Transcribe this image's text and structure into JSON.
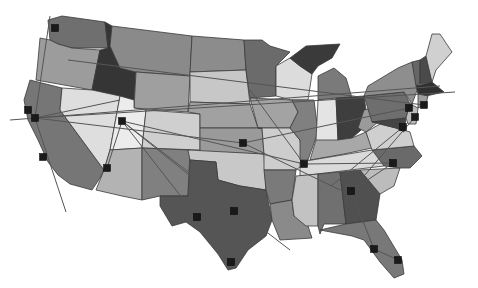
{
  "map": {
    "title": "",
    "background": "#ffffff",
    "states": [
      {
        "id": "WA",
        "fill": "#6f6f6f",
        "points": "48,20 62,16 105,22 108,48 72,48 58,44 50,40"
      },
      {
        "id": "OR",
        "fill": "#9c9c9c",
        "points": "40,38 50,40 58,44 72,48 100,50 92,90 36,80 38,60"
      },
      {
        "id": "CA",
        "fill": "#767676",
        "points": "30,80 62,88 60,110 104,170 100,178 92,190 70,184 58,175 48,162 38,140 28,120 24,100"
      },
      {
        "id": "ID",
        "fill": "#353535",
        "points": "105,22 112,26 110,46 120,68 136,72 134,100 92,90 100,50 108,48"
      },
      {
        "id": "NV",
        "fill": "#dedede",
        "points": "62,88 92,90 120,96 110,150 104,170 60,110"
      },
      {
        "id": "MT",
        "fill": "#8a8a8a",
        "points": "112,26 192,36 190,76 136,72 120,68 110,46"
      },
      {
        "id": "WY",
        "fill": "#9f9f9f",
        "points": "136,72 190,76 188,112 134,108"
      },
      {
        "id": "UT",
        "fill": "#ececec",
        "points": "120,96 134,100 134,108 146,110 142,148 110,150"
      },
      {
        "id": "AZ",
        "fill": "#b3b3b3",
        "points": "110,150 142,148 142,200 122,196 96,190 104,170"
      },
      {
        "id": "CO",
        "fill": "#cfcfcf",
        "points": "146,110 200,114 200,150 142,148"
      },
      {
        "id": "NM",
        "fill": "#808080",
        "points": "142,148 190,150 188,196 160,196 142,200"
      },
      {
        "id": "ND",
        "fill": "#8c8c8c",
        "points": "192,36 244,40 246,70 190,72"
      },
      {
        "id": "SD",
        "fill": "#c7c7c7",
        "points": "190,72 246,70 250,104 190,102"
      },
      {
        "id": "NE",
        "fill": "#a1a1a1",
        "points": "190,102 250,104 258,128 200,128 200,114 188,112"
      },
      {
        "id": "KS",
        "fill": "#9a9a9a",
        "points": "200,128 262,128 264,154 200,152"
      },
      {
        "id": "OK",
        "fill": "#c8c8c8",
        "points": "188,150 264,154 266,190 240,186 218,180 216,162 190,160"
      },
      {
        "id": "TX",
        "fill": "#555555",
        "points": "190,160 216,162 218,180 240,186 266,190 272,220 266,236 248,250 236,268 228,270 218,254 200,232 186,222 172,226 160,206 160,196 188,196"
      },
      {
        "id": "MN",
        "fill": "#6b6b6b",
        "points": "244,40 262,40 270,46 290,52 276,66 276,96 250,98 246,70"
      },
      {
        "id": "IA",
        "fill": "#a3a3a3",
        "points": "250,98 292,100 298,112 290,128 258,128"
      },
      {
        "id": "MO",
        "fill": "#cdcdcd",
        "points": "258,128 290,128 300,140 304,164 296,170 264,170 264,154 262,128"
      },
      {
        "id": "AR",
        "fill": "#7a7a7a",
        "points": "264,170 296,170 292,200 270,204 266,190"
      },
      {
        "id": "LA",
        "fill": "#8a8a8a",
        "points": "270,204 292,200 294,216 306,220 312,238 280,240 272,220"
      },
      {
        "id": "WI",
        "fill": "#dcdcdc",
        "points": "276,66 290,58 300,66 312,74 308,100 292,100 276,96"
      },
      {
        "id": "IL",
        "fill": "#808080",
        "points": "292,100 314,100 318,132 308,160 300,160 300,140 290,128 298,112"
      },
      {
        "id": "MI",
        "fill": "#3a3a3a",
        "points": "306,46 340,44 332,58 318,66 312,74 300,66 290,58"
      },
      {
        "id": "MI2",
        "fill": "#7a7a7a",
        "points": "318,76 334,68 346,78 352,98 318,100"
      },
      {
        "id": "IN",
        "fill": "#e4e4e4",
        "points": "318,100 336,98 338,140 322,148 316,140"
      },
      {
        "id": "OH",
        "fill": "#3e3e3e",
        "points": "336,98 364,96 368,124 352,138 338,140"
      },
      {
        "id": "KY",
        "fill": "#a8a8a8",
        "points": "316,140 338,140 352,138 366,132 372,148 344,154 310,160"
      },
      {
        "id": "TN",
        "fill": "#dadada",
        "points": "300,162 372,150 392,152 384,166 300,176"
      },
      {
        "id": "MS",
        "fill": "#c2c2c2",
        "points": "296,176 318,174 318,226 306,226 294,216 292,200"
      },
      {
        "id": "AL",
        "fill": "#707070",
        "points": "318,174 340,172 346,224 324,224 320,234 318,226"
      },
      {
        "id": "GA",
        "fill": "#505050",
        "points": "340,172 360,170 380,194 376,220 346,224"
      },
      {
        "id": "FL",
        "fill": "#787878",
        "points": "320,230 346,224 376,220 384,230 402,260 404,274 394,278 380,262 364,240 352,236"
      },
      {
        "id": "SC",
        "fill": "#bcbcbc",
        "points": "360,170 400,168 394,186 380,194"
      },
      {
        "id": "NC",
        "fill": "#6a6a6a",
        "points": "372,150 414,146 422,156 410,168 400,168 384,166"
      },
      {
        "id": "VA",
        "fill": "#cfcfcf",
        "points": "366,132 380,124 396,128 410,132 414,146 372,150"
      },
      {
        "id": "WV",
        "fill": "#9a9a9a",
        "points": "364,110 372,108 378,122 366,132 358,128"
      },
      {
        "id": "PA",
        "fill": "#6e6e6e",
        "points": "364,96 404,92 410,104 406,118 372,122"
      },
      {
        "id": "NY",
        "fill": "#8e8e8e",
        "points": "368,86 398,68 412,62 418,88 412,104 404,92 364,96"
      },
      {
        "id": "MD",
        "fill": "#444444",
        "points": "372,122 406,118 404,132 396,128 380,124"
      },
      {
        "id": "NJ",
        "fill": "#bcbcbc",
        "points": "410,104 418,108 416,124 408,124 406,118"
      },
      {
        "id": "VT",
        "fill": "#666666",
        "points": "412,62 420,60 420,84 416,86"
      },
      {
        "id": "NH",
        "fill": "#4a4a4a",
        "points": "420,60 426,56 432,82 420,84"
      },
      {
        "id": "ME",
        "fill": "#d0d0d0",
        "points": "426,56 432,34 440,34 452,52 436,70 432,82"
      },
      {
        "id": "MA",
        "fill": "#303030",
        "points": "416,86 432,82 444,92 426,96 418,94"
      },
      {
        "id": "CT",
        "fill": "#9e9e9e",
        "points": "418,94 428,96 426,104 418,108"
      }
    ],
    "markers": [
      {
        "name": "Seattle",
        "x": 55,
        "y": 28
      },
      {
        "name": "San Francisco",
        "x": 28,
        "y": 110
      },
      {
        "name": "Oakland",
        "x": 35,
        "y": 118
      },
      {
        "name": "Los Angeles",
        "x": 43,
        "y": 157
      },
      {
        "name": "Phoenix",
        "x": 107,
        "y": 168
      },
      {
        "name": "Salt Lake City",
        "x": 122,
        "y": 121
      },
      {
        "name": "Kansas City",
        "x": 243,
        "y": 143
      },
      {
        "name": "St. Louis",
        "x": 304,
        "y": 164
      },
      {
        "name": "Fort Worth",
        "x": 197,
        "y": 217
      },
      {
        "name": "Dallas",
        "x": 234,
        "y": 211
      },
      {
        "name": "Houston",
        "x": 231,
        "y": 262
      },
      {
        "name": "Atlanta",
        "x": 351,
        "y": 191
      },
      {
        "name": "Charlotte",
        "x": 393,
        "y": 163
      },
      {
        "name": "Tampa",
        "x": 374,
        "y": 249
      },
      {
        "name": "Miami",
        "x": 398,
        "y": 260
      },
      {
        "name": "Boston",
        "x": 424,
        "y": 105
      },
      {
        "name": "New York",
        "x": 409,
        "y": 108
      },
      {
        "name": "Philadelphia",
        "x": 415,
        "y": 117
      },
      {
        "name": "Washington",
        "x": 403,
        "y": 127
      }
    ],
    "routes": [
      {
        "x1": 10,
        "y1": 120,
        "x2": 440,
        "y2": 86
      },
      {
        "x1": 35,
        "y1": 118,
        "x2": 455,
        "y2": 92
      },
      {
        "x1": 68,
        "y1": 60,
        "x2": 424,
        "y2": 105
      },
      {
        "x1": 50,
        "y1": 16,
        "x2": 35,
        "y2": 118
      },
      {
        "x1": 35,
        "y1": 118,
        "x2": 66,
        "y2": 212
      },
      {
        "x1": 35,
        "y1": 118,
        "x2": 243,
        "y2": 143
      },
      {
        "x1": 35,
        "y1": 118,
        "x2": 120,
        "y2": 100
      },
      {
        "x1": 122,
        "y1": 121,
        "x2": 304,
        "y2": 164
      },
      {
        "x1": 122,
        "y1": 121,
        "x2": 234,
        "y2": 211
      },
      {
        "x1": 122,
        "y1": 121,
        "x2": 197,
        "y2": 217
      },
      {
        "x1": 122,
        "y1": 121,
        "x2": 107,
        "y2": 168
      },
      {
        "x1": 122,
        "y1": 121,
        "x2": 290,
        "y2": 250
      },
      {
        "x1": 234,
        "y1": 211,
        "x2": 231,
        "y2": 262
      },
      {
        "x1": 243,
        "y1": 143,
        "x2": 409,
        "y2": 108
      },
      {
        "x1": 243,
        "y1": 143,
        "x2": 340,
        "y2": 190
      },
      {
        "x1": 304,
        "y1": 164,
        "x2": 393,
        "y2": 163
      },
      {
        "x1": 304,
        "y1": 164,
        "x2": 250,
        "y2": 90
      },
      {
        "x1": 351,
        "y1": 191,
        "x2": 374,
        "y2": 249
      },
      {
        "x1": 351,
        "y1": 191,
        "x2": 393,
        "y2": 163
      },
      {
        "x1": 351,
        "y1": 191,
        "x2": 415,
        "y2": 117
      },
      {
        "x1": 374,
        "y1": 249,
        "x2": 398,
        "y2": 260
      },
      {
        "x1": 331,
        "y1": 186,
        "x2": 403,
        "y2": 127
      }
    ]
  }
}
